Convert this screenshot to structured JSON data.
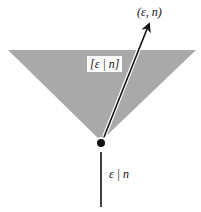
{
  "diagram": {
    "labels": {
      "arrow_tip": "(ε, n)",
      "cone": "[ε | n]",
      "stem": "ε | n"
    },
    "colors": {
      "cone_fill": "#a9a9a9",
      "line": "#111111",
      "background": "#ffffff"
    },
    "elements": {
      "cone": "gray inverted triangle",
      "point": "black dot at apex",
      "arrow": "arrow from apex to upper right",
      "stem": "vertical line below apex"
    }
  }
}
